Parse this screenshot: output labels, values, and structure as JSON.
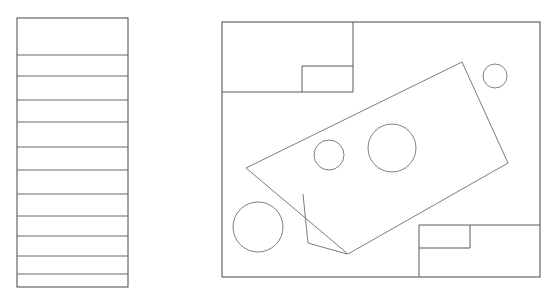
{
  "canvas": {
    "width": 553,
    "height": 307,
    "background": "#ffffff",
    "title": "Technical line drawing with stratigraphic column and plan view"
  },
  "style": {
    "line_color": "#5a5a5a",
    "panel_color": "#565656",
    "divider_color": "#6b6b6b",
    "shape_color": "#7b7b7b",
    "circle_color": "#7f7f7f",
    "stroke_width": 1
  },
  "left_panel": {
    "name": "layered-column",
    "x": 17,
    "y": 18,
    "width": 111,
    "height": 269,
    "divider_count": 11,
    "divider_y": [
      55,
      76,
      100,
      122,
      147,
      170,
      194,
      216,
      236,
      256,
      274
    ]
  },
  "right_panel": {
    "name": "plan-view",
    "x": 222,
    "y": 22,
    "width": 318,
    "height": 255,
    "top_left_block": {
      "name": "top-left-block",
      "x": 222,
      "y": 22,
      "width": 131,
      "height": 70
    },
    "top_left_inner_block": {
      "name": "top-left-inner-block",
      "x": 302,
      "y": 66,
      "width": 51,
      "height": 26
    },
    "bottom_right_block": {
      "name": "bottom-right-block",
      "x": 419,
      "y": 225,
      "width": 121,
      "height": 52
    },
    "bottom_right_inner_block": {
      "name": "bottom-right-inner-block",
      "x": 419,
      "y": 225,
      "width": 51,
      "height": 23
    },
    "rotated_rectangle": {
      "name": "rotated-rectangle",
      "points": "246,168 462,62 508,163 348,254"
    },
    "notch_polyline": {
      "name": "notch-polyline",
      "points": "303,194 308,243 347,254"
    },
    "circles": [
      {
        "name": "circle-bottom-left",
        "cx": 258,
        "cy": 227,
        "r": 25
      },
      {
        "name": "circle-small-mid",
        "cx": 329,
        "cy": 155,
        "r": 15
      },
      {
        "name": "circle-medium-mid",
        "cx": 392,
        "cy": 148,
        "r": 24
      },
      {
        "name": "circle-top-right",
        "cx": 495,
        "cy": 76,
        "r": 12
      }
    ]
  }
}
